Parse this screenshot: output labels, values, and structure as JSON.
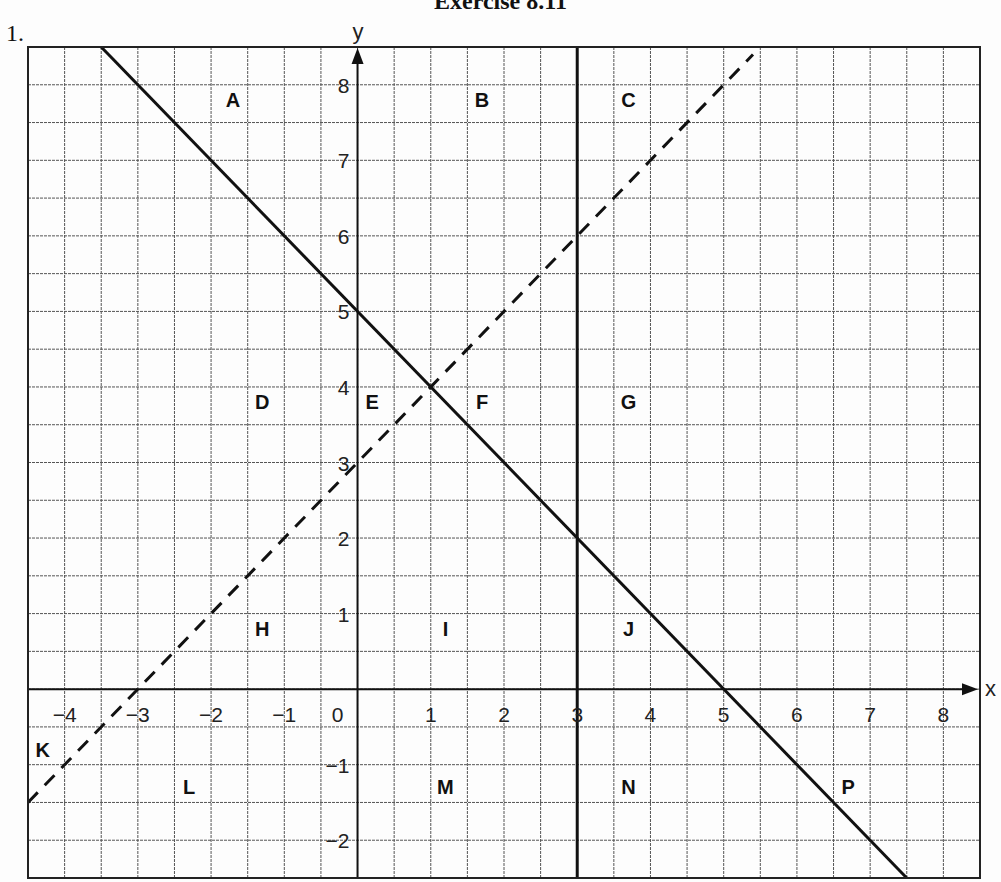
{
  "page": {
    "heading": "Exercise 8.11",
    "question_number": "1."
  },
  "chart_data": {
    "type": "line",
    "title": "",
    "xlabel": "x",
    "ylabel": "y",
    "xlim": [
      -4.5,
      8.5
    ],
    "ylim": [
      -2.5,
      8.5
    ],
    "grid": true,
    "grid_step": 0.5,
    "x_ticks": [
      -4,
      -3,
      -2,
      -1,
      0,
      1,
      2,
      3,
      4,
      5,
      6,
      7,
      8
    ],
    "y_ticks": [
      -2,
      -1,
      1,
      2,
      3,
      4,
      5,
      6,
      7,
      8
    ],
    "x_tick_labels": [
      "−4",
      "−3",
      "−2",
      "−1",
      "0",
      "1",
      "2",
      "3",
      "4",
      "5",
      "6",
      "7",
      "8"
    ],
    "y_tick_labels": [
      "−2",
      "−1",
      "1",
      "2",
      "3",
      "4",
      "5",
      "6",
      "7",
      "8"
    ],
    "series": [
      {
        "name": "y = 5 − x",
        "style": "solid",
        "x": [
          -3.5,
          7.5
        ],
        "y": [
          8.5,
          -2.5
        ]
      },
      {
        "name": "y = x + 3",
        "style": "dashed",
        "x": [
          -4.5,
          5.4
        ],
        "y": [
          -1.5,
          8.4
        ]
      },
      {
        "name": "x = 3",
        "style": "solid",
        "x": [
          3,
          3
        ],
        "y": [
          -2.5,
          8.5
        ]
      }
    ],
    "region_labels": [
      {
        "label": "A",
        "x": -1.7,
        "y": 7.8
      },
      {
        "label": "B",
        "x": 1.7,
        "y": 7.8
      },
      {
        "label": "C",
        "x": 3.7,
        "y": 7.8
      },
      {
        "label": "D",
        "x": -1.3,
        "y": 3.8
      },
      {
        "label": "E",
        "x": 0.2,
        "y": 3.8
      },
      {
        "label": "F",
        "x": 1.7,
        "y": 3.8
      },
      {
        "label": "G",
        "x": 3.7,
        "y": 3.8
      },
      {
        "label": "H",
        "x": -1.3,
        "y": 0.8
      },
      {
        "label": "I",
        "x": 1.2,
        "y": 0.8
      },
      {
        "label": "J",
        "x": 3.7,
        "y": 0.8
      },
      {
        "label": "K",
        "x": -4.3,
        "y": -0.8
      },
      {
        "label": "L",
        "x": -2.3,
        "y": -1.3
      },
      {
        "label": "M",
        "x": 1.2,
        "y": -1.3
      },
      {
        "label": "N",
        "x": 3.7,
        "y": -1.3
      },
      {
        "label": "P",
        "x": 6.7,
        "y": -1.3
      }
    ]
  },
  "colors": {
    "ink": "#111111",
    "grid": "#555555",
    "paper": "#fdfdfd"
  }
}
